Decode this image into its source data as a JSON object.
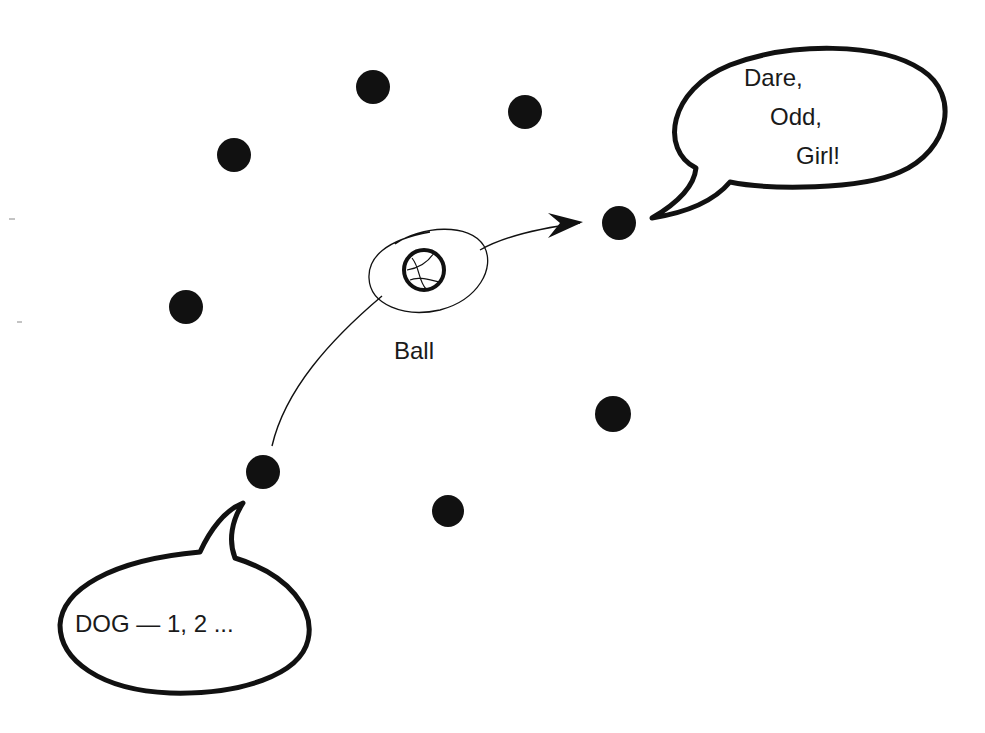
{
  "diagram": {
    "background": "#ffffff",
    "ink_color": "#111111",
    "players": [
      {
        "id": "p1",
        "cx": 373,
        "cy": 87
      },
      {
        "id": "p2",
        "cx": 525,
        "cy": 112
      },
      {
        "id": "p3",
        "cx": 234,
        "cy": 155
      },
      {
        "id": "p4",
        "cx": 619,
        "cy": 223
      },
      {
        "id": "p5",
        "cx": 186,
        "cy": 307
      },
      {
        "id": "p6",
        "cx": 613,
        "cy": 414
      },
      {
        "id": "p7",
        "cx": 263,
        "cy": 472
      },
      {
        "id": "p8",
        "cx": 448,
        "cy": 511
      }
    ],
    "ball": {
      "label": "Ball",
      "icon": "basketball-icon"
    },
    "speech_bubbles": {
      "top_right": {
        "lines": [
          "Dare,",
          "Odd,",
          "Girl!"
        ]
      },
      "bottom_left": {
        "text": "DOG — 1, 2 ..."
      }
    },
    "arrows": [
      {
        "from": "p7",
        "to": "ball",
        "arrowhead": false
      },
      {
        "from": "ball",
        "to": "p4",
        "arrowhead": true
      }
    ]
  }
}
